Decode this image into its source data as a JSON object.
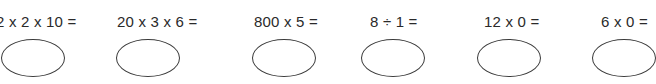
{
  "problems": [
    {
      "expression": "2 x 2 x 10 =",
      "answer": ""
    },
    {
      "expression": "20 x 3 x 6 =",
      "answer": ""
    },
    {
      "expression": "800 x 5 =",
      "answer": ""
    },
    {
      "expression": "8 ÷ 1 =",
      "answer": ""
    },
    {
      "expression": "12 x 0 =",
      "answer": ""
    },
    {
      "expression": "6 x 0 =",
      "answer": ""
    }
  ]
}
